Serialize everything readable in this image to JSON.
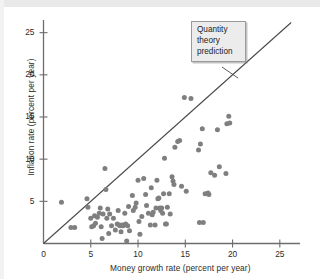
{
  "figure": {
    "title": "",
    "annotation": {
      "name": "quantity-theory-prediction-callout",
      "lines": [
        "Quantity",
        "theory",
        "prediction"
      ],
      "text": "Quantity theory prediction"
    }
  },
  "colors": {
    "point": "#7f7f7f",
    "axis": "#6d6d6d",
    "line": "#4a4a4a",
    "text": "#2b2b2b",
    "callout_fill": "#ececec",
    "callout_border": "#9a9a9a",
    "background": "#ffffff"
  },
  "chart_data": {
    "type": "scatter",
    "title": "",
    "subtitle": "",
    "xlabel": "Money growth rate (percent per year)",
    "ylabel": "Inflation rate (percent per year)",
    "xlim": [
      0,
      26.5
    ],
    "ylim": [
      0,
      26.5
    ],
    "xticks": [
      0,
      5,
      10,
      15,
      20,
      25
    ],
    "yticks": [
      5,
      10,
      15,
      20,
      25
    ],
    "xtick_labels": [
      "0",
      "5",
      "10",
      "15",
      "20",
      "25"
    ],
    "ytick_labels": [
      "5",
      "10",
      "15",
      "20",
      "25"
    ],
    "grid": false,
    "legend": null,
    "annotations": [
      {
        "text": "Quantity theory prediction",
        "x": 16.2,
        "y": 24.4,
        "leader_to": [
          20.6,
          19.6
        ]
      }
    ],
    "reference_line": {
      "name": "quantity-theory-prediction",
      "type": "identity",
      "from": [
        0,
        0
      ],
      "to": [
        26.2,
        26.2
      ],
      "slope": 1,
      "intercept": 0
    },
    "series": [
      {
        "name": "Countries",
        "marker": "circle",
        "color": "#7f7f7f",
        "points": [
          [
            1.9,
            4.9
          ],
          [
            2.9,
            1.9
          ],
          [
            3.3,
            1.9
          ],
          [
            4.6,
            5.3
          ],
          [
            4.7,
            4.3
          ],
          [
            5.0,
            3.0
          ],
          [
            5.1,
            2.0
          ],
          [
            5.3,
            2.1
          ],
          [
            5.4,
            3.3
          ],
          [
            5.5,
            2.4
          ],
          [
            5.7,
            3.1
          ],
          [
            5.9,
            3.6
          ],
          [
            6.0,
            4.2
          ],
          [
            6.1,
            2.0
          ],
          [
            6.2,
            0.6
          ],
          [
            6.3,
            3.5
          ],
          [
            6.5,
            8.9
          ],
          [
            6.6,
            6.4
          ],
          [
            6.7,
            3.0
          ],
          [
            6.8,
            4.1
          ],
          [
            6.9,
            1.2
          ],
          [
            7.0,
            3.5
          ],
          [
            7.2,
            2.1
          ],
          [
            7.4,
            3.0
          ],
          [
            7.6,
            1.6
          ],
          [
            7.8,
            2.3
          ],
          [
            7.9,
            3.9
          ],
          [
            8.0,
            2.2
          ],
          [
            8.1,
            2.1
          ],
          [
            8.2,
            1.4
          ],
          [
            8.3,
            2.2
          ],
          [
            8.4,
            2.1
          ],
          [
            8.5,
            2.2
          ],
          [
            8.6,
            3.6
          ],
          [
            8.7,
            2.3
          ],
          [
            8.8,
            0.3
          ],
          [
            8.9,
            2.1
          ],
          [
            9.0,
            4.4
          ],
          [
            9.1,
            1.5
          ],
          [
            9.4,
            5.7
          ],
          [
            9.5,
            3.9
          ],
          [
            9.7,
            4.3
          ],
          [
            9.8,
            4.8
          ],
          [
            10.0,
            7.5
          ],
          [
            10.1,
            2.6
          ],
          [
            10.2,
            1.1
          ],
          [
            10.4,
            3.2
          ],
          [
            10.6,
            7.7
          ],
          [
            10.8,
            5.8
          ],
          [
            10.9,
            4.5
          ],
          [
            11.1,
            3.6
          ],
          [
            11.3,
            2.2
          ],
          [
            11.4,
            6.6
          ],
          [
            11.5,
            3.4
          ],
          [
            11.6,
            3.7
          ],
          [
            11.8,
            2.2
          ],
          [
            11.9,
            4.2
          ],
          [
            12.0,
            7.5
          ],
          [
            12.1,
            5.3
          ],
          [
            12.2,
            5.4
          ],
          [
            12.3,
            4.2
          ],
          [
            12.4,
            3.9
          ],
          [
            12.5,
            4.2
          ],
          [
            12.6,
            3.6
          ],
          [
            12.7,
            5.9
          ],
          [
            12.8,
            10.1
          ],
          [
            12.9,
            2.3
          ],
          [
            13.0,
            2.3
          ],
          [
            13.1,
            4.3
          ],
          [
            13.3,
            5.9
          ],
          [
            13.4,
            3.5
          ],
          [
            13.6,
            7.9
          ],
          [
            13.7,
            7.4
          ],
          [
            13.8,
            7.0
          ],
          [
            13.9,
            11.4
          ],
          [
            14.2,
            12.1
          ],
          [
            14.4,
            12.2
          ],
          [
            14.6,
            6.8
          ],
          [
            14.9,
            17.3
          ],
          [
            15.1,
            6.2
          ],
          [
            15.6,
            17.2
          ],
          [
            16.4,
            11.1
          ],
          [
            16.5,
            2.5
          ],
          [
            16.9,
            2.5
          ],
          [
            16.6,
            11.8
          ],
          [
            16.8,
            13.6
          ],
          [
            17.1,
            5.9
          ],
          [
            17.4,
            6.0
          ],
          [
            17.5,
            5.8
          ],
          [
            17.7,
            8.4
          ],
          [
            18.1,
            8.1
          ],
          [
            18.4,
            13.5
          ],
          [
            18.6,
            9.1
          ],
          [
            19.3,
            8.3
          ],
          [
            19.4,
            14.2
          ],
          [
            19.6,
            15.1
          ],
          [
            19.7,
            14.3
          ]
        ]
      }
    ]
  }
}
